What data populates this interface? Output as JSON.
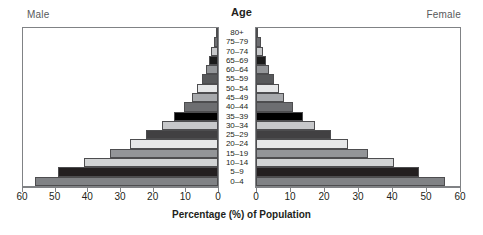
{
  "chart_data": {
    "type": "bar",
    "title": "Age",
    "subtitle": "",
    "xlabel": "Percentage (%) of Population",
    "ylabel": "Age",
    "orientation": "horizontal-diverging",
    "layout": "population-pyramid",
    "grid": false,
    "legend_position": "none",
    "left_panel_label": "Male",
    "right_panel_label": "Female",
    "xlim": [
      0,
      60
    ],
    "xticks": [
      0,
      10,
      20,
      30,
      40,
      50,
      60
    ],
    "xtick_labels_left": [
      "60",
      "50",
      "40",
      "30",
      "20",
      "10",
      "0"
    ],
    "xtick_labels_right": [
      "0",
      "10",
      "20",
      "30",
      "40",
      "50",
      "60"
    ],
    "categories": [
      "80+",
      "75–79",
      "70–74",
      "65–69",
      "60–64",
      "55–59",
      "50–54",
      "45–49",
      "40–44",
      "35–39",
      "30–34",
      "25–29",
      "20–24",
      "15–19",
      "10–14",
      "5–9",
      "0–4"
    ],
    "series": [
      {
        "name": "Male",
        "side": "left",
        "values": [
          0.7,
          1.3,
          2.0,
          2.8,
          3.7,
          5.0,
          6.5,
          8.0,
          10.5,
          13.5,
          17.0,
          22.0,
          27.0,
          33.0,
          41.0,
          49.0,
          56.0
        ]
      },
      {
        "name": "Female",
        "side": "right",
        "values": [
          0.7,
          1.4,
          2.1,
          2.9,
          3.8,
          5.2,
          6.7,
          8.2,
          10.8,
          13.8,
          17.3,
          22.0,
          27.0,
          33.0,
          40.5,
          48.0,
          55.5
        ]
      }
    ],
    "bar_fill_colors": [
      "#ffffff",
      "#6d6e71",
      "#c7c8ca",
      "#1b1b1b",
      "#939598",
      "#58595b",
      "#e6e7e8",
      "#a7a9ac",
      "#6d6e71",
      "#000000",
      "#c7c8ca",
      "#414042",
      "#e6e7e8",
      "#939598",
      "#d1d3d4",
      "#231f20",
      "#808285"
    ]
  },
  "colors": {
    "frame": "#808285",
    "text": "#231f20",
    "muted_text": "#58595b",
    "background": "#ffffff"
  }
}
